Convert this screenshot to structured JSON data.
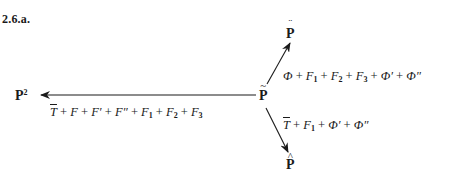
{
  "figure": {
    "label": "2.6.a.",
    "nodes": {
      "center": {
        "symbol": "P",
        "accent": "~",
        "name": "P-tilde"
      },
      "top": {
        "symbol": "P",
        "accent": "¨",
        "name": "P-double-dot"
      },
      "left": {
        "symbol": "P",
        "superscript": "2",
        "name": "P-squared"
      },
      "bottom": {
        "symbol": "P",
        "accent": "^",
        "name": "P-hat"
      }
    },
    "arrows": {
      "to_top": {
        "from": "center",
        "to": "top",
        "terms": [
          {
            "base": "Φ",
            "sub": ""
          },
          {
            "base": "F",
            "sub": "1"
          },
          {
            "base": "F",
            "sub": "2"
          },
          {
            "base": "F",
            "sub": "3"
          },
          {
            "base": "Φ′",
            "sub": ""
          },
          {
            "base": "Φ″",
            "sub": ""
          }
        ],
        "separator": " + "
      },
      "to_left": {
        "from": "center",
        "to": "left",
        "terms": [
          {
            "base": "T",
            "sub": "",
            "overline": true
          },
          {
            "base": "F",
            "sub": ""
          },
          {
            "base": "F′",
            "sub": ""
          },
          {
            "base": "F″",
            "sub": ""
          },
          {
            "base": "F",
            "sub": "1"
          },
          {
            "base": "F",
            "sub": "2"
          },
          {
            "base": "F",
            "sub": "3"
          }
        ],
        "separator": " + "
      },
      "to_bottom": {
        "from": "center",
        "to": "bottom",
        "terms": [
          {
            "base": "T",
            "sub": "",
            "overline": true
          },
          {
            "base": "F",
            "sub": "1"
          },
          {
            "base": "Φ′",
            "sub": ""
          },
          {
            "base": "Φ″",
            "sub": ""
          }
        ],
        "separator": " + "
      }
    },
    "colors": {
      "ink": "#1a1a1a",
      "background": "#ffffff"
    }
  }
}
